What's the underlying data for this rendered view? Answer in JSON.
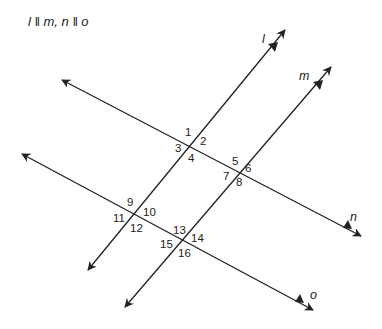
{
  "caption": "l ‖ m, n ‖ o",
  "lines": {
    "l": {
      "label": "l"
    },
    "m": {
      "label": "m"
    },
    "n": {
      "label": "n"
    },
    "o": {
      "label": "o"
    }
  },
  "angles": [
    "1",
    "2",
    "3",
    "4",
    "5",
    "6",
    "7",
    "8",
    "9",
    "10",
    "11",
    "12",
    "13",
    "14",
    "15",
    "16"
  ],
  "colors": {
    "stroke": "#222222",
    "background": "#ffffff"
  }
}
